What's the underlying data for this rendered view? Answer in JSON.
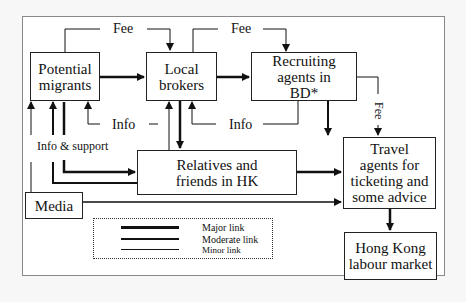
{
  "diagram": {
    "nodes": {
      "potential_migrants": "Potential migrants",
      "local_brokers": "Local brokers",
      "recruiting_agents": "Recruiting agents in BD*",
      "relatives_friends": "Relatives and friends in HK",
      "travel_agents": "Travel agents for ticketing and some advice",
      "hk_labour_market": "Hong Kong labour market",
      "media": "Media"
    },
    "edge_labels": {
      "fee_1": "Fee",
      "fee_2": "Fee",
      "fee_3": "Fee",
      "info_1": "Info",
      "info_2": "Info",
      "info_support": "Info & support"
    },
    "legend": {
      "major": "Major link",
      "moderate": "Moderate link",
      "minor": "Minor link"
    }
  }
}
